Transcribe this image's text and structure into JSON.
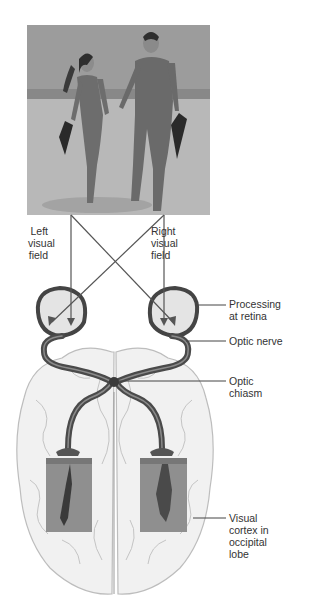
{
  "figure": {
    "photo": {
      "description": "Couple in wetsuits walking on beach holding hands and carrying flippers",
      "icon": "photo-couple-beach"
    },
    "field_labels": {
      "left": [
        "Left",
        "visual",
        "field"
      ],
      "right": [
        "Right",
        "visual",
        "field"
      ]
    },
    "callouts": [
      {
        "id": "processing-at-retina",
        "lines": [
          "Processing",
          "at retina"
        ]
      },
      {
        "id": "optic-nerve",
        "lines": [
          "Optic nerve"
        ]
      },
      {
        "id": "optic-chiasm",
        "lines": [
          "Optic",
          "chiasm"
        ]
      },
      {
        "id": "visual-cortex",
        "lines": [
          "Visual",
          "cortex in",
          "occipital",
          "lobe"
        ]
      }
    ],
    "cortex_images": {
      "left": "inverted-image-woman",
      "right": "inverted-image-man"
    },
    "colors": {
      "nerve": "#4a4a4a",
      "nerve_highlight": "#8a8a8a",
      "eye_fill": "#e4e4e4",
      "brain_fill": "#f1f1f1",
      "brain_line": "#b9b9b9",
      "photo_sky": "#9a9a9a",
      "photo_sand": "#b3b3b3",
      "arrow": "#555555"
    }
  }
}
